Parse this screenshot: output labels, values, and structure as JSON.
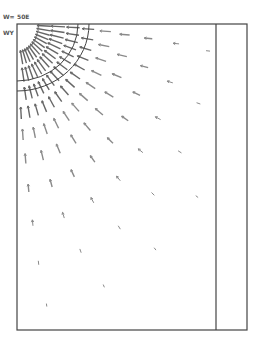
{
  "figure": {
    "type": "radial vector field around quarter-circular hole",
    "labels": {
      "top_left_1": "W=",
      "top_left_2": "50E",
      "side_label": "WY"
    },
    "frame": {
      "left": 17,
      "top": 24,
      "right": 247,
      "bottom": 330,
      "inner_line_x": 216
    },
    "arcs": {
      "center": [
        17,
        24
      ],
      "inner": {
        "rx": 61,
        "ry": 57
      },
      "outer": {
        "rx": 72,
        "ry": 67
      }
    },
    "arrows": {
      "direction": "inward-radial",
      "rings": [
        {
          "r": 25,
          "count": 14,
          "len": 14
        },
        {
          "r": 38,
          "count": 16,
          "len": 14
        },
        {
          "r": 52,
          "count": 16,
          "len": 13
        },
        {
          "r": 66,
          "count": 14,
          "len": 12
        },
        {
          "r": 82,
          "count": 12,
          "len": 11
        },
        {
          "r": 100,
          "count": 10,
          "len": 10
        },
        {
          "r": 122,
          "count": 9,
          "len": 8
        },
        {
          "r": 148,
          "count": 8,
          "len": 6
        },
        {
          "r": 178,
          "count": 7,
          "len": 4
        },
        {
          "r": 210,
          "count": 6,
          "len": 3
        }
      ]
    },
    "colors": {
      "frame": "#444444",
      "arrow": "#8a8a8a",
      "arrow_dark": "#666666",
      "text": "#555555"
    }
  }
}
